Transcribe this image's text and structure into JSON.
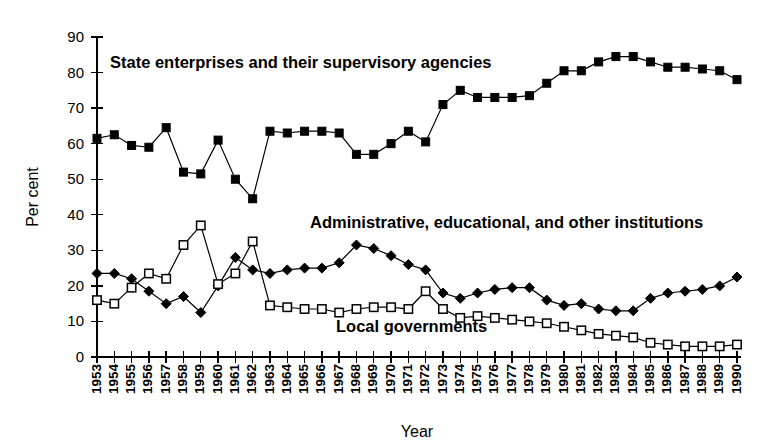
{
  "chart_data": {
    "type": "line",
    "title": "",
    "xlabel": "Year",
    "ylabel": "Per cent",
    "ylim": [
      0,
      90
    ],
    "ytick_step": 10,
    "grid": false,
    "legend_position": "inline-annotations",
    "x": [
      1953,
      1954,
      1955,
      1956,
      1957,
      1958,
      1959,
      1960,
      1961,
      1962,
      1963,
      1964,
      1965,
      1966,
      1967,
      1968,
      1969,
      1970,
      1971,
      1972,
      1973,
      1974,
      1975,
      1976,
      1977,
      1978,
      1979,
      1980,
      1981,
      1982,
      1983,
      1984,
      1985,
      1986,
      1987,
      1988,
      1989,
      1990
    ],
    "xtick_labels": [
      "1953",
      "1954",
      "1955",
      "1956",
      "1957",
      "1958",
      "1959",
      "1960",
      "1961",
      "1962",
      "1963",
      "1964",
      "1965",
      "1966",
      "1967",
      "1968",
      "1969",
      "1970",
      "1971",
      "1972",
      "1973",
      "1974",
      "1975",
      "1976",
      "1977",
      "1978",
      "1979",
      "1980",
      "1981",
      "1982",
      "1983",
      "1984",
      "1985",
      "1986",
      "1987",
      "1988",
      "1989",
      "1990"
    ],
    "ytick_labels": [
      "0",
      "10",
      "20",
      "30",
      "40",
      "50",
      "60",
      "70",
      "80",
      "90"
    ],
    "ytick_values": [
      0,
      10,
      20,
      30,
      40,
      50,
      60,
      70,
      80,
      90
    ],
    "series": [
      {
        "name": "State enterprises and their supervisory agencies",
        "marker": "filled-square",
        "values": [
          61.5,
          62.5,
          59.5,
          59.0,
          64.5,
          52.0,
          51.5,
          61.0,
          50.0,
          44.5,
          63.5,
          63.0,
          63.5,
          63.5,
          63.0,
          57.0,
          57.0,
          60.0,
          63.5,
          60.5,
          71.0,
          75.0,
          73.0,
          73.0,
          73.0,
          73.5,
          77.0,
          80.5,
          80.5,
          83.0,
          84.5,
          84.5,
          83.0,
          81.5,
          81.5,
          81.0,
          80.5,
          78.0
        ]
      },
      {
        "name": "Administrative, educational, and other institutions",
        "marker": "filled-diamond",
        "values": [
          23.5,
          23.5,
          22.0,
          18.5,
          15.0,
          17.0,
          12.5,
          20.0,
          28.0,
          24.5,
          23.5,
          24.5,
          25.0,
          25.0,
          26.5,
          31.5,
          30.5,
          28.5,
          26.0,
          24.5,
          18.0,
          16.5,
          18.0,
          19.0,
          19.5,
          19.5,
          16.0,
          14.5,
          15.0,
          13.5,
          13.0,
          13.0,
          16.5,
          18.0,
          18.5,
          19.0,
          20.0,
          22.5
        ]
      },
      {
        "name": "Local governments",
        "marker": "open-square",
        "values": [
          16.0,
          15.0,
          19.5,
          23.5,
          22.0,
          31.5,
          37.0,
          20.5,
          23.5,
          32.5,
          14.5,
          14.0,
          13.5,
          13.5,
          12.5,
          13.5,
          14.0,
          14.0,
          13.5,
          18.5,
          13.5,
          11.0,
          11.5,
          11.0,
          10.5,
          10.0,
          9.5,
          8.5,
          7.5,
          6.5,
          6.0,
          5.5,
          4.0,
          3.5,
          3.0,
          3.0,
          3.0,
          3.5
        ]
      }
    ],
    "annotations": [
      {
        "text": "State enterprises and their supervisory agencies",
        "x_px": 110,
        "y_px": 68
      },
      {
        "text": "Administrative, educational, and other institutions",
        "x_px": 310,
        "y_px": 228
      },
      {
        "text": "Local governments",
        "x_px": 336,
        "y_px": 332
      }
    ]
  },
  "layout": {
    "plot_left_px": 97,
    "plot_right_px": 737,
    "plot_bottom_px": 357,
    "plot_top_px": 37,
    "xtick_label_y_px": 364,
    "ylabel_x_px": 38,
    "ylabel_y_px": 197,
    "xlabel_x_px": 417,
    "xlabel_y_px": 437
  },
  "colors": {
    "background": "#ffffff",
    "foreground": "#000000"
  }
}
